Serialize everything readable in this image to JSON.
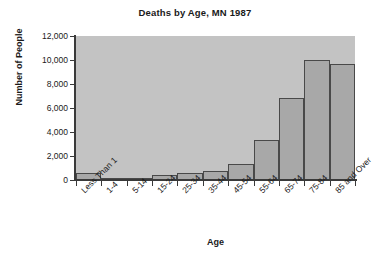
{
  "chart_data": {
    "type": "bar",
    "title": "Deaths by Age, MN 1987",
    "xlabel": "Age",
    "ylabel": "Number of People",
    "categories": [
      "Less Than 1",
      "1-4",
      "5-14",
      "15-24",
      "25-34",
      "35-44",
      "45-54",
      "55-64",
      "65-74",
      "75-84",
      "85 and Over"
    ],
    "values": [
      580,
      110,
      160,
      420,
      560,
      710,
      1320,
      3350,
      6850,
      10000,
      9650
    ],
    "ylim": [
      0,
      12000
    ],
    "ytick_values": [
      0,
      2000,
      4000,
      6000,
      8000,
      10000,
      12000
    ],
    "ytick_labels": [
      "0",
      "2,000",
      "4,000",
      "6,000",
      "8,000",
      "10,000",
      "12,000"
    ],
    "grid": false,
    "legend": "none",
    "colors": {
      "bar_fill": "#a8a8a8",
      "bar_edge": "#494949",
      "plot_background": "#c3c3c3",
      "axis": "#3a3a3a",
      "text": "#1a1a1a",
      "figure_background": "#ffffff"
    }
  }
}
